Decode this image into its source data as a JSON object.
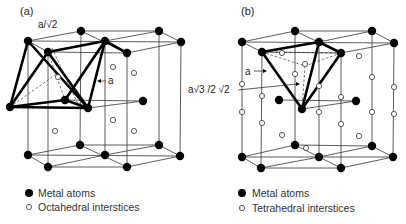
{
  "figure": {
    "panel_a": {
      "label": "(a)",
      "dimension_labels": {
        "top": "a/√2",
        "edge": "a"
      },
      "legend": [
        {
          "symbol": "filled-circle",
          "text": "Metal atoms"
        },
        {
          "symbol": "open-circle",
          "text": "Octahedral interstices"
        }
      ]
    },
    "panel_b": {
      "label": "(b)",
      "dimension_labels": {
        "edge": "a",
        "height": "a√3 /2 √2"
      },
      "legend": [
        {
          "symbol": "filled-circle",
          "text": "Metal atoms"
        },
        {
          "symbol": "open-circle",
          "text": "Tetrahedral interstices"
        }
      ]
    },
    "colors": {
      "atom": "#000000",
      "interstice_fill": "#ffffff",
      "line": "#333333"
    }
  }
}
